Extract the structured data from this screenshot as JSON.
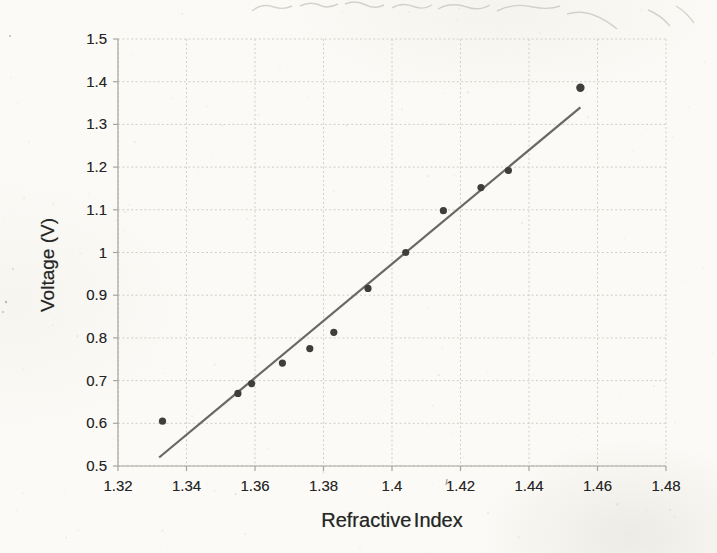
{
  "chart_data": {
    "type": "scatter",
    "title": "",
    "xlabel": "Refractive Index",
    "ylabel": "Voltage (V)",
    "xlim": [
      1.32,
      1.48
    ],
    "ylim": [
      0.5,
      1.5
    ],
    "x_ticks": [
      1.32,
      1.34,
      1.36,
      1.38,
      1.4,
      1.42,
      1.44,
      1.46,
      1.48
    ],
    "x_tick_labels": [
      "1.32",
      "1.34",
      "1.36",
      "1.38",
      "1.4",
      "1.42",
      "1.44",
      "1.46",
      "1.48"
    ],
    "y_ticks": [
      0.5,
      0.6,
      0.7,
      0.8,
      0.9,
      1,
      1.1,
      1.2,
      1.3,
      1.4,
      1.5
    ],
    "y_tick_labels": [
      "0.5",
      "0.6",
      "0.7",
      "0.8",
      "0.9",
      "1",
      "1.1",
      "1.2",
      "1.3",
      "1.4",
      "1.5"
    ],
    "grid": true,
    "legend": null,
    "series": [
      {
        "name": "voltage-vs-refractive-index",
        "marker": "circle",
        "points": [
          {
            "x": 1.333,
            "y": 0.605
          },
          {
            "x": 1.355,
            "y": 0.67
          },
          {
            "x": 1.359,
            "y": 0.693
          },
          {
            "x": 1.368,
            "y": 0.741
          },
          {
            "x": 1.376,
            "y": 0.775
          },
          {
            "x": 1.383,
            "y": 0.813
          },
          {
            "x": 1.393,
            "y": 0.916
          },
          {
            "x": 1.404,
            "y": 1.0
          },
          {
            "x": 1.415,
            "y": 1.098
          },
          {
            "x": 1.426,
            "y": 1.152
          },
          {
            "x": 1.434,
            "y": 1.192
          },
          {
            "x": 1.455,
            "y": 1.386
          }
        ]
      }
    ],
    "trendline": {
      "x1": 1.332,
      "y1": 0.52,
      "x2": 1.455,
      "y2": 1.34
    },
    "colors": {
      "background": "#fbfaf6",
      "grid": "#c9ccc4",
      "axis": "#a6a69d",
      "point": "#3f3e3c",
      "trend": "#686864",
      "text": "#262626"
    }
  }
}
